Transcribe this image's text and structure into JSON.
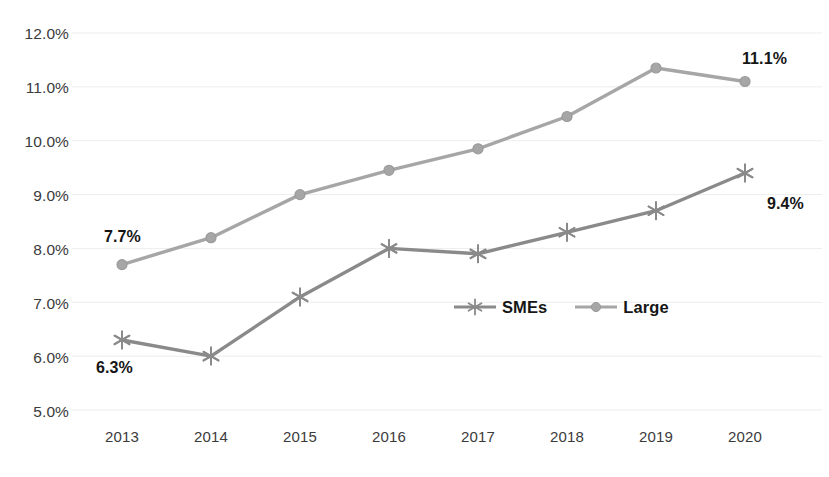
{
  "chart_data": {
    "type": "line",
    "title": "",
    "subtitle": "",
    "xlabel": "",
    "ylabel": "",
    "categories": [
      "2013",
      "2014",
      "2015",
      "2016",
      "2017",
      "2018",
      "2019",
      "2020"
    ],
    "series": [
      {
        "name": "SMEs",
        "marker": "asterisk",
        "color": "#8a8a8a",
        "values": [
          6.3,
          6.0,
          7.1,
          8.0,
          7.9,
          8.3,
          8.7,
          9.4
        ]
      },
      {
        "name": "Large",
        "marker": "circle",
        "color": "#a6a6a6",
        "values": [
          7.7,
          8.2,
          9.0,
          9.45,
          9.85,
          10.45,
          11.35,
          11.1
        ]
      }
    ],
    "ylim": [
      5.0,
      12.0
    ],
    "y_tick_labels": [
      "12.0%",
      "11.0%",
      "10.0%",
      "9.0%",
      "8.0%",
      "7.0%",
      "6.0%",
      "5.0%"
    ],
    "y_tick_values": [
      12.0,
      11.0,
      10.0,
      9.0,
      8.0,
      7.0,
      6.0,
      5.0
    ],
    "grid": true,
    "grid_color": "#ededed",
    "legend_position": "center",
    "value_format": "percent",
    "annotations": [
      {
        "text": "7.7%",
        "series": "Large",
        "category": "2013",
        "value": 7.7
      },
      {
        "text": "6.3%",
        "series": "SMEs",
        "category": "2013",
        "value": 6.3
      },
      {
        "text": "11.1%",
        "series": "Large",
        "category": "2020",
        "value": 11.1
      },
      {
        "text": "9.4%",
        "series": "SMEs",
        "category": "2020",
        "value": 9.4
      }
    ]
  },
  "axis": {
    "y_labels": [
      "12.0%",
      "11.0%",
      "10.0%",
      "9.0%",
      "8.0%",
      "7.0%",
      "6.0%",
      "5.0%"
    ],
    "x_labels": [
      "2013",
      "2014",
      "2015",
      "2016",
      "2017",
      "2018",
      "2019",
      "2020"
    ]
  },
  "legend": {
    "items": [
      {
        "label": "SMEs",
        "marker": "asterisk-marker-icon",
        "color": "#8a8a8a"
      },
      {
        "label": "Large",
        "marker": "circle-marker-icon",
        "color": "#a6a6a6"
      }
    ]
  },
  "labels": {
    "large_first": "7.7%",
    "smes_first": "6.3%",
    "large_last": "11.1%",
    "smes_last": "9.4%"
  }
}
